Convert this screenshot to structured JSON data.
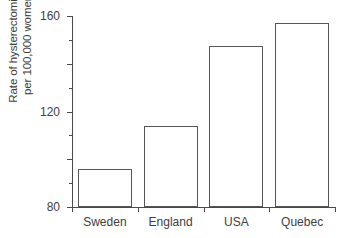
{
  "chart_data": {
    "type": "bar",
    "title": "",
    "xlabel": "",
    "ylabel_line1": "Rate of hysterectomies",
    "ylabel_line2": "per 100,000 women",
    "categories": [
      "Sweden",
      "England",
      "USA",
      "Quebec"
    ],
    "values": [
      32,
      68,
      135,
      154
    ],
    "ylim": [
      0,
      160
    ],
    "yticks": [
      0,
      40,
      80,
      120,
      160
    ],
    "ytick_labels": [
      "0",
      "40",
      "80",
      "120",
      "160"
    ],
    "yminor_ticks": [
      20,
      60,
      100,
      140
    ],
    "grid": false,
    "legend": false,
    "series": [
      {
        "name": "Rate of hysterectomies per 100,000 women",
        "values": [
          32,
          68,
          135,
          154
        ]
      }
    ],
    "bar_fill_color": "#ffffff",
    "bar_edge_color": "#555555",
    "axis_color": "#4a4a4a",
    "background_color": "#ffffff"
  }
}
